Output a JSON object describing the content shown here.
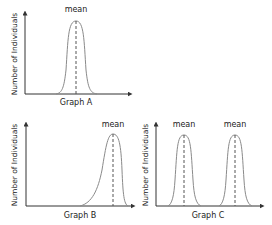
{
  "graphs": [
    {
      "id": "A",
      "title": "Graph A",
      "ylabel": "Number of Individuals",
      "means": [
        "mean"
      ],
      "distribution": "normal, centered"
    },
    {
      "id": "B",
      "title": "Graph B",
      "ylabel": "Number of Individuals",
      "means": [
        "mean"
      ],
      "distribution": "skewed, shifted right"
    },
    {
      "id": "C",
      "title": "Graph C",
      "ylabel": "Number of Individuals",
      "means": [
        "mean",
        "mean"
      ],
      "distribution": "bimodal"
    }
  ],
  "colors": {
    "axis": "#333333",
    "curve": "#8a8a8a",
    "mean_line": "#555555"
  }
}
